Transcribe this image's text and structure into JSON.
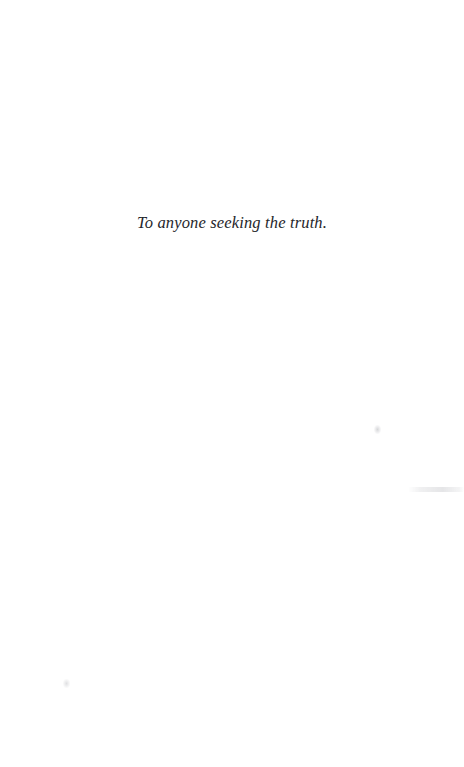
{
  "page": {
    "kind": "book-dedication-page",
    "background_color": "#ffffff",
    "width": 464,
    "height": 767
  },
  "dedication": {
    "text": "To anyone seeking the truth.",
    "text_color": "#25262b",
    "alignment": "center",
    "style": "italic-serif"
  },
  "artifacts": [
    {
      "name": "speck-right",
      "description": "faint gray speck"
    },
    {
      "name": "streak-right",
      "description": "faint horizontal gray streak near right edge"
    },
    {
      "name": "speck-left",
      "description": "faint gray speck near lower left"
    }
  ]
}
